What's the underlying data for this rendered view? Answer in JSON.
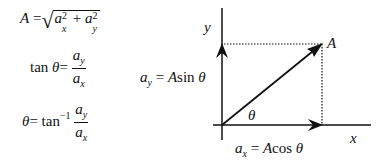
{
  "equations": {
    "magnitude": {
      "lhs": "A",
      "eq": "=",
      "radical": "√",
      "term1_base": "a",
      "term1_sub": "x",
      "term1_sup": "2",
      "plus": "+",
      "term2_base": "a",
      "term2_sub": "y",
      "term2_sup": "2"
    },
    "tangent": {
      "lhs_fn": "tan",
      "lhs_var": "θ",
      "eq": "=",
      "num_base": "a",
      "num_sub": "y",
      "den_base": "a",
      "den_sub": "x"
    },
    "angle": {
      "lhs": "θ",
      "eq": "=",
      "fn": "tan",
      "fn_sup": "−1",
      "num_base": "a",
      "num_sub": "y",
      "den_base": "a",
      "den_sub": "x"
    }
  },
  "diagram": {
    "y_axis_label": "y",
    "x_axis_label": "x",
    "vector_label": "A",
    "angle_label": "θ",
    "ay_label": {
      "base": "a",
      "sub": "y",
      "rest": " = ",
      "A": "A",
      "fn": "sin ",
      "var": "θ"
    },
    "ax_label": {
      "base": "a",
      "sub": "x",
      "rest": " = ",
      "A": "A",
      "fn": "cos ",
      "var": "θ"
    },
    "colors": {
      "line": "#111111",
      "background": "#ffffff"
    }
  }
}
